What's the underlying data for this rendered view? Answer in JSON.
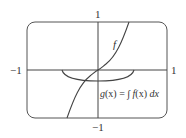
{
  "figure": {
    "axis_labels": {
      "x_min": "−1",
      "x_max": "1",
      "y_max": "1",
      "y_min": "−1"
    },
    "curves": [
      {
        "name": "f",
        "label": "f"
      },
      {
        "name": "g",
        "label_parts": {
          "g": "g",
          "x1": "(x)",
          "eq": " = ",
          "int": "∫",
          "f": " f",
          "x2": "(x)",
          "dx": " dx"
        }
      }
    ],
    "colors": {
      "stroke": "#444444",
      "background": "#ffffff"
    }
  }
}
